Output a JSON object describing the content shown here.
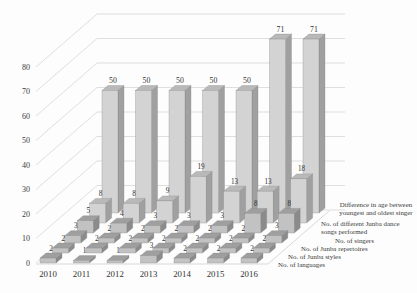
{
  "chart_data": {
    "type": "bar",
    "subtype": "3d-column",
    "title": "",
    "xlabel": "",
    "ylabel": "",
    "categories": [
      "2010",
      "2011",
      "2012",
      "2013",
      "2014",
      "2015",
      "2016"
    ],
    "series": [
      {
        "name": "No. of languages",
        "values": [
          2,
          1,
          1,
          3,
          2,
          2,
          2
        ]
      },
      {
        "name": "No. of Junba styles",
        "values": [
          2,
          2,
          2,
          2,
          2,
          2,
          2
        ]
      },
      {
        "name": "No. of Junba repertoires",
        "values": [
          3,
          2,
          2,
          2,
          2,
          2,
          3
        ]
      },
      {
        "name": "No. of singers",
        "values": [
          5,
          4,
          3,
          3,
          3,
          8,
          8
        ]
      },
      {
        "name": "No. of different Junba dance songs performed",
        "values": [
          8,
          8,
          9,
          19,
          13,
          13,
          18
        ]
      },
      {
        "name": "Difference in age between youngest and oldest singer",
        "values": [
          50,
          50,
          50,
          50,
          50,
          71,
          71
        ]
      }
    ],
    "yticks": [
      0,
      10,
      20,
      30,
      40,
      50,
      60,
      70,
      80
    ],
    "ylim": [
      0,
      90
    ],
    "grid": true,
    "data_labels": true,
    "legend_position": "right-diagonal",
    "legend_order_back_to_front": [
      [
        "Difference in age between",
        "youngest and oldest singer"
      ],
      [
        "No. of different Junba dance",
        "songs performed"
      ],
      [
        "No. of singers"
      ],
      [
        "No. of Junba repertoires"
      ],
      [
        "No. of Junba styles"
      ],
      [
        "No. of languages"
      ]
    ],
    "colors": {
      "bar_front_back_rows": "#d3d3d3",
      "bar_front_front_rows": "#c2c2c2",
      "bar_top_back_rows": "#b9b9b9",
      "bar_top_front_rows": "#9f9f9f",
      "bar_side_back_rows": "#a0a0a0",
      "bar_side_front_rows": "#8b8b8b",
      "bar_stroke": "#808080",
      "gridline": "#c9c9c9",
      "text": "#3a3a3a",
      "background": "#fdfdfd"
    }
  }
}
